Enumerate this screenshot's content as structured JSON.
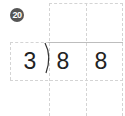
{
  "problem": {
    "number_badge": "20",
    "divisor": "3",
    "dividend_digits": [
      "8",
      "8"
    ],
    "answer_digits": [
      "",
      ""
    ],
    "work_rows": [
      [
        "",
        ""
      ]
    ]
  },
  "colors": {
    "badge_bg": "#555555",
    "grid_line": "#d4d4d4",
    "text": "#222222"
  }
}
